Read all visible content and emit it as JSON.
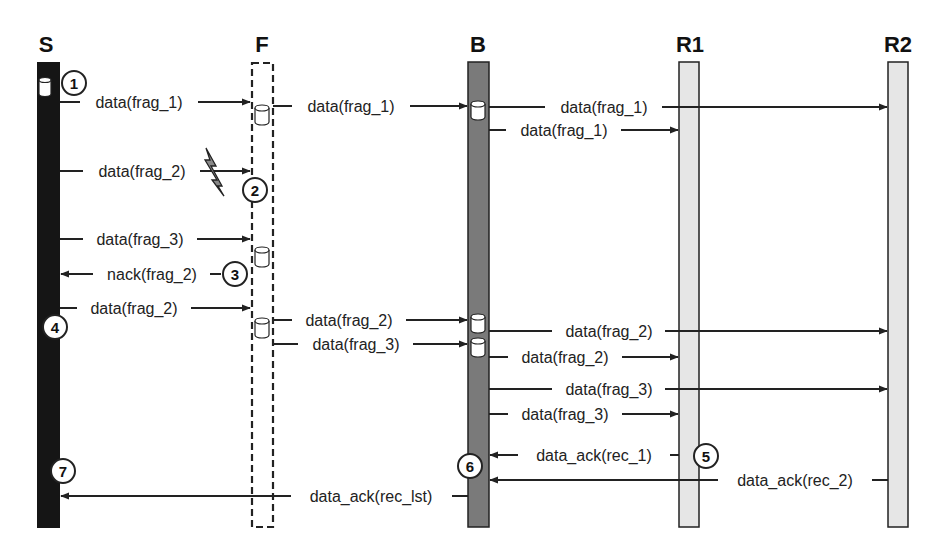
{
  "diagram": {
    "colors": {
      "S": "#151515",
      "F": "#ffffff",
      "B": "#7a7a7a",
      "R1": "#e6e6e6",
      "R2": "#e6e6e6",
      "line": "#222222"
    },
    "lifelines": [
      {
        "id": "S",
        "label": "S"
      },
      {
        "id": "F",
        "label": "F"
      },
      {
        "id": "B",
        "label": "B"
      },
      {
        "id": "R1",
        "label": "R1"
      },
      {
        "id": "R2",
        "label": "R2"
      }
    ],
    "messages": [
      {
        "from": "S",
        "to": "F",
        "label": "data(frag_1)"
      },
      {
        "from": "F",
        "to": "B",
        "label": "data(frag_1)"
      },
      {
        "from": "B",
        "to": "R2",
        "label": "data(frag_1)"
      },
      {
        "from": "B",
        "to": "R1",
        "label": "data(frag_1)"
      },
      {
        "from": "S",
        "to": "F",
        "label": "data(frag_2)",
        "lost": true
      },
      {
        "from": "S",
        "to": "F",
        "label": "data(frag_3)"
      },
      {
        "from": "F",
        "to": "S",
        "label": "nack(frag_2)"
      },
      {
        "from": "S",
        "to": "F",
        "label": "data(frag_2)"
      },
      {
        "from": "F",
        "to": "B",
        "label": "data(frag_2)"
      },
      {
        "from": "F",
        "to": "B",
        "label": "data(frag_3)"
      },
      {
        "from": "B",
        "to": "R2",
        "label": "data(frag_2)"
      },
      {
        "from": "B",
        "to": "R1",
        "label": "data(frag_2)"
      },
      {
        "from": "B",
        "to": "R2",
        "label": "data(frag_3)"
      },
      {
        "from": "B",
        "to": "R1",
        "label": "data(frag_3)"
      },
      {
        "from": "R1",
        "to": "B",
        "label": "data_ack(rec_1)"
      },
      {
        "from": "R2",
        "to": "B",
        "label": "data_ack(rec_2)"
      },
      {
        "from": "B",
        "to": "S",
        "label": "data_ack(rec_lst)"
      }
    ],
    "steps": [
      "1",
      "2",
      "3",
      "4",
      "5",
      "6",
      "7"
    ],
    "icons": {
      "storage": "storage-cylinder-icon",
      "loss": "lightning-loss-icon"
    }
  }
}
